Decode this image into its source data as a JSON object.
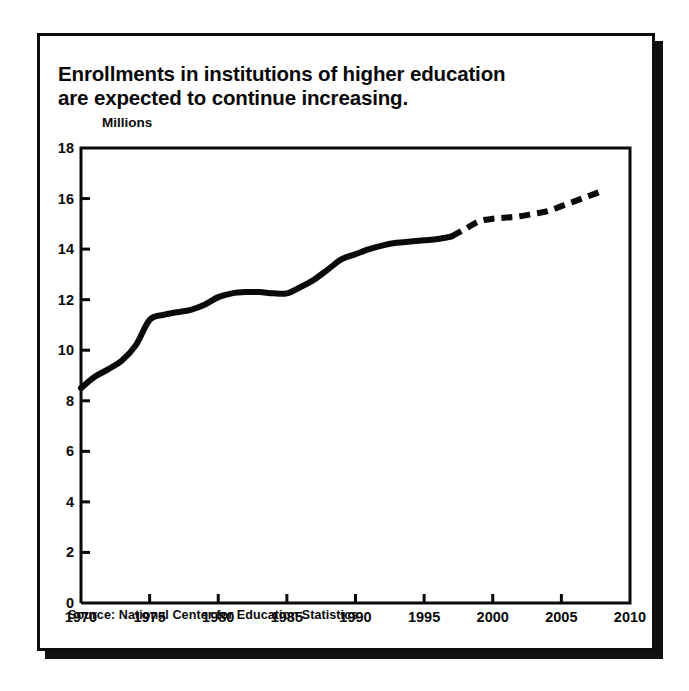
{
  "figure": {
    "title": "Enrollments in institutions of higher education\nare expected to continue increasing.",
    "source": "Source: National Center for Education Statistics",
    "ink_color": "#0a0a0a",
    "background_color": "#ffffff"
  },
  "chart_data": {
    "type": "line",
    "title": "Enrollments in institutions of higher education are expected to continue increasing.",
    "xlabel": "",
    "ylabel": "Millions",
    "ylim": [
      0,
      18
    ],
    "xlim": [
      1970,
      2010
    ],
    "ytick_labels": [
      "0",
      "2",
      "4",
      "6",
      "8",
      "10",
      "12",
      "14",
      "16",
      "18"
    ],
    "yticks": [
      0,
      2,
      4,
      6,
      8,
      10,
      12,
      14,
      16,
      18
    ],
    "xtick_labels": [
      "1970",
      "1975",
      "1980",
      "1985",
      "1990",
      "1995",
      "2000",
      "2005",
      "2010"
    ],
    "xticks": [
      1970,
      1975,
      1980,
      1985,
      1990,
      1995,
      2000,
      2005,
      2010
    ],
    "grid": false,
    "legend": "none",
    "series": [
      {
        "name": "Actual enrollment",
        "style": "solid",
        "linewidth": 6,
        "color": "#0a0a0a",
        "x": [
          1970,
          1971,
          1972,
          1973,
          1974,
          1975,
          1976,
          1977,
          1978,
          1979,
          1980,
          1981,
          1982,
          1983,
          1984,
          1985,
          1986,
          1987,
          1988,
          1989,
          1990,
          1991,
          1992,
          1993,
          1994,
          1995,
          1996,
          1997
        ],
        "values": [
          8.5,
          8.95,
          9.25,
          9.6,
          10.2,
          11.2,
          11.4,
          11.5,
          11.6,
          11.8,
          12.1,
          12.25,
          12.3,
          12.3,
          12.25,
          12.25,
          12.5,
          12.8,
          13.2,
          13.6,
          13.8,
          14.0,
          14.15,
          14.25,
          14.3,
          14.35,
          14.4,
          14.5
        ]
      },
      {
        "name": "Projected enrollment",
        "style": "dashed",
        "linewidth": 6,
        "color": "#0a0a0a",
        "x": [
          1997,
          1998,
          1999,
          2000,
          2001,
          2002,
          2003,
          2004,
          2005,
          2006,
          2007,
          2008
        ],
        "values": [
          14.5,
          14.8,
          15.1,
          15.2,
          15.25,
          15.3,
          15.4,
          15.5,
          15.7,
          15.9,
          16.1,
          16.3
        ]
      }
    ]
  }
}
